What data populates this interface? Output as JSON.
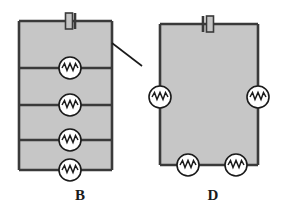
{
  "figure": {
    "type": "circuit-diagram-pair",
    "background_color": "#ffffff",
    "fill_color": "#c6c6c6",
    "wire_color": "#3a3a3a",
    "component_fill": "#ffffff"
  },
  "circuits": [
    {
      "id": "circuit-b",
      "label": "B",
      "label_x": 80,
      "label_y": 197,
      "topology": "parallel",
      "frame": {
        "x": 19,
        "y": 21,
        "width": 93,
        "height": 149
      },
      "battery": {
        "x": 70,
        "y": 21,
        "label": "battery"
      },
      "branches_y": [
        68,
        105,
        140
      ],
      "resistors": [
        {
          "cx": 70,
          "cy": 68,
          "r": 11,
          "orientation": "horizontal"
        },
        {
          "cx": 70,
          "cy": 105,
          "r": 11,
          "orientation": "horizontal"
        },
        {
          "cx": 70,
          "cy": 140,
          "r": 11,
          "orientation": "horizontal"
        },
        {
          "cx": 70,
          "cy": 170,
          "r": 11,
          "orientation": "horizontal"
        }
      ],
      "leader_line": {
        "x1": 112,
        "y1": 43,
        "x2": 142,
        "y2": 66
      },
      "resistor_count": 4
    },
    {
      "id": "circuit-d",
      "label": "D",
      "label_x": 213,
      "label_y": 197,
      "topology": "series",
      "frame": {
        "x": 160,
        "y": 24,
        "width": 98,
        "height": 141
      },
      "battery": {
        "x": 210,
        "y": 24,
        "label": "battery"
      },
      "branches_y": [],
      "resistors": [
        {
          "cx": 160,
          "cy": 97,
          "r": 11,
          "orientation": "vertical"
        },
        {
          "cx": 258,
          "cy": 97,
          "r": 11,
          "orientation": "vertical"
        },
        {
          "cx": 188,
          "cy": 165,
          "r": 11,
          "orientation": "horizontal"
        },
        {
          "cx": 236,
          "cy": 165,
          "r": 11,
          "orientation": "horizontal"
        }
      ],
      "leader_line": null,
      "resistor_count": 4
    }
  ]
}
